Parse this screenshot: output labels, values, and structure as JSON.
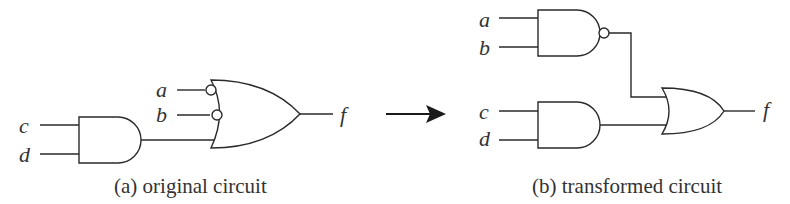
{
  "figure": {
    "panel_a": {
      "caption": "(a) original circuit",
      "inputs": [
        "a",
        "b",
        "c",
        "d"
      ],
      "output": "f",
      "gates": [
        {
          "type": "AND",
          "inputs": [
            "c",
            "d"
          ]
        },
        {
          "type": "OR",
          "inputs": [
            "a (inverted)",
            "b (inverted)",
            "AND(c,d)"
          ],
          "output": "f"
        }
      ]
    },
    "arrow": {
      "direction": "right"
    },
    "panel_b": {
      "caption": "(b) transformed circuit",
      "inputs": [
        "a",
        "b",
        "c",
        "d"
      ],
      "output": "f",
      "gates": [
        {
          "type": "NAND",
          "inputs": [
            "a",
            "b"
          ]
        },
        {
          "type": "AND",
          "inputs": [
            "c",
            "d"
          ]
        },
        {
          "type": "OR",
          "inputs": [
            "NAND(a,b)",
            "AND(c,d)"
          ],
          "output": "f"
        }
      ]
    },
    "labels": {
      "a": "a",
      "b": "b",
      "c": "c",
      "d": "d",
      "f": "f"
    }
  }
}
